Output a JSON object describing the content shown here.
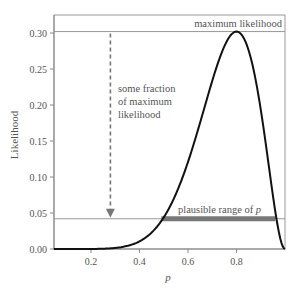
{
  "chart_data": {
    "type": "line",
    "title": "",
    "xlabel": "p",
    "ylabel": "Likelihood",
    "xlim": [
      0.047,
      1.0
    ],
    "ylim": [
      0.0,
      0.325
    ],
    "x_ticks": [
      0.2,
      0.4,
      0.6,
      0.8
    ],
    "x_tick_labels": [
      "0.2",
      "0.4",
      "0.6",
      "0.8"
    ],
    "y_ticks": [
      0.0,
      0.05,
      0.1,
      0.15,
      0.2,
      0.25,
      0.3
    ],
    "y_tick_labels": [
      "0.00",
      "0.05",
      "0.10",
      "0.15",
      "0.20",
      "0.25",
      "0.30"
    ],
    "grid": false,
    "series": [
      {
        "name": "Likelihood curve (binomial, 8 of 10)",
        "x": [
          0.05,
          0.1,
          0.15,
          0.2,
          0.25,
          0.3,
          0.35,
          0.4,
          0.45,
          0.5,
          0.55,
          0.6,
          0.65,
          0.7,
          0.75,
          0.8,
          0.85,
          0.9,
          0.95,
          1.0
        ],
        "y": [
          0.0,
          0.0,
          0.0,
          0.0001,
          0.0004,
          0.0014,
          0.0043,
          0.0106,
          0.0229,
          0.0439,
          0.0763,
          0.1209,
          0.1757,
          0.2335,
          0.2816,
          0.302,
          0.2759,
          0.1937,
          0.0746,
          0.0
        ]
      }
    ],
    "reference_lines": [
      {
        "name": "maximum likelihood",
        "y": 0.302
      },
      {
        "name": "threshold",
        "y": 0.042
      }
    ],
    "highlight_range": {
      "label": "plausible range of p",
      "x_start": 0.49,
      "x_end": 0.96,
      "y": 0.042
    },
    "annotations": [
      {
        "text": "maximum likelihood",
        "position": "top-right"
      },
      {
        "text": "some fraction of maximum likelihood",
        "arrow_from_y": 0.302,
        "arrow_to_y": 0.045,
        "x": 0.28
      },
      {
        "text": "plausible range of p",
        "position": "above range bar"
      }
    ]
  },
  "labels": {
    "ylabel": "Likelihood",
    "xlabel": "p",
    "max_label": "maximum likelihood",
    "fraction_line1": "some fraction",
    "fraction_line2": "of maximum",
    "fraction_line3": "likelihood",
    "range_label": "plausible range of p",
    "range_label_prefix": "plausible range of ",
    "range_label_var": "p"
  },
  "colors": {
    "curve": "#111111",
    "axis": "#888888",
    "bar": "#777777",
    "text": "#555555",
    "arrow": "#777777"
  }
}
